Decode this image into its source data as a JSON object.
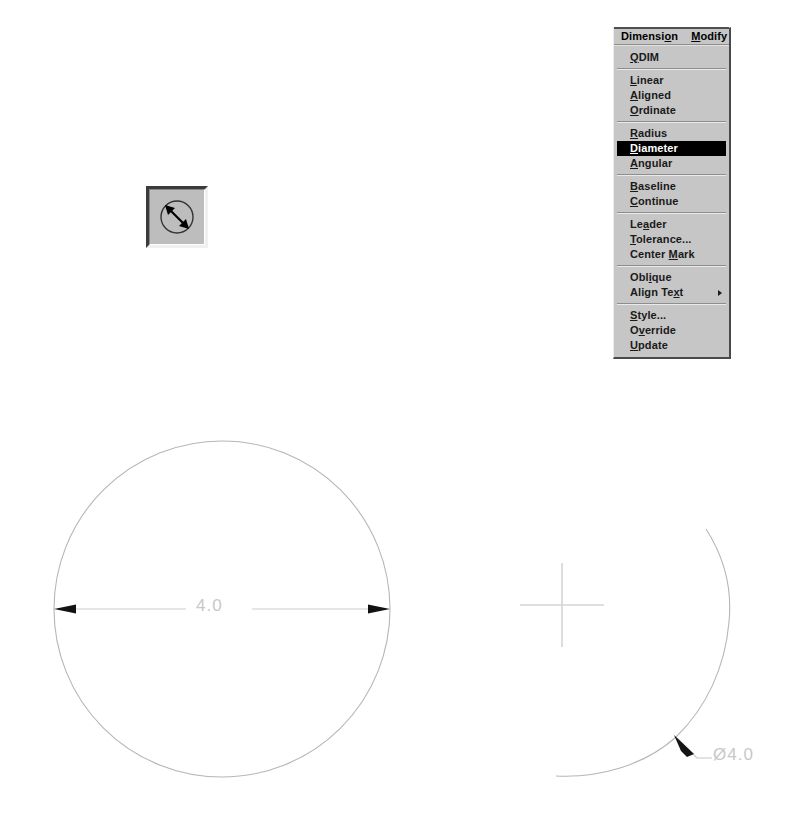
{
  "app": {
    "title": "AutoCAD Dimension Menu",
    "canvas_background": "#ffffff"
  },
  "toolbar": {
    "button": {
      "name": "diameter-dimension-tool",
      "tooltip_label": "Diameter",
      "icon": "circle-diameter-arrow-icon",
      "state": "pressed",
      "face_color": "#bdbdbd"
    }
  },
  "menu": {
    "bar": [
      {
        "label": "Dimension",
        "mnemonic_index": 7,
        "active": true
      },
      {
        "label": "Modify",
        "mnemonic_index": 0,
        "active": false
      }
    ],
    "dropdown_title": "Dimension",
    "groups": [
      {
        "items": [
          {
            "label": "QDIM",
            "mnemonic_index": 0,
            "selected": false,
            "submenu": false
          }
        ]
      },
      {
        "items": [
          {
            "label": "Linear",
            "mnemonic_index": 0,
            "selected": false,
            "submenu": false
          },
          {
            "label": "Aligned",
            "mnemonic_index": 0,
            "selected": false,
            "submenu": false
          },
          {
            "label": "Ordinate",
            "mnemonic_index": 0,
            "selected": false,
            "submenu": false
          }
        ]
      },
      {
        "items": [
          {
            "label": "Radius",
            "mnemonic_index": 0,
            "selected": false,
            "submenu": false
          },
          {
            "label": "Diameter",
            "mnemonic_index": 0,
            "selected": true,
            "submenu": false
          },
          {
            "label": "Angular",
            "mnemonic_index": 0,
            "selected": false,
            "submenu": false
          }
        ]
      },
      {
        "items": [
          {
            "label": "Baseline",
            "mnemonic_index": 0,
            "selected": false,
            "submenu": false
          },
          {
            "label": "Continue",
            "mnemonic_index": 0,
            "selected": false,
            "submenu": false
          }
        ]
      },
      {
        "items": [
          {
            "label": "Leader",
            "mnemonic_index": 2,
            "selected": false,
            "submenu": false
          },
          {
            "label": "Tolerance...",
            "mnemonic_index": 0,
            "selected": false,
            "submenu": false
          },
          {
            "label": "Center Mark",
            "mnemonic_index": 7,
            "selected": false,
            "submenu": false
          }
        ]
      },
      {
        "items": [
          {
            "label": "Oblique",
            "mnemonic_index": 3,
            "selected": false,
            "submenu": false
          },
          {
            "label": "Align Text",
            "mnemonic_index": 8,
            "selected": false,
            "submenu": true
          }
        ]
      },
      {
        "items": [
          {
            "label": "Style...",
            "mnemonic_index": 0,
            "selected": false,
            "submenu": false
          },
          {
            "label": "Override",
            "mnemonic_index": 1,
            "selected": false,
            "submenu": false
          },
          {
            "label": "Update",
            "mnemonic_index": 0,
            "selected": false,
            "submenu": false
          }
        ]
      }
    ],
    "colors": {
      "face": "#c6c6c6",
      "highlight_bg": "#000000",
      "highlight_fg": "#ffffff",
      "text": "#1a1a1a"
    }
  },
  "drawing": {
    "geometry_color": "#b4b4b4",
    "dimension_color": "#c8c8c8",
    "arrow_color": "#111111",
    "left_circle": {
      "name": "dimensioned-circle",
      "center_x": 222,
      "center_y": 609,
      "radius": 168
    },
    "left_dimension": {
      "name": "diameter-dimension-horizontal",
      "value": "4.0",
      "x1": 54,
      "x2": 390,
      "y": 609
    },
    "right_arc": {
      "name": "target-circle-arc",
      "center_x": 418,
      "center_y": 612,
      "radius": 312
    },
    "right_dimension": {
      "name": "diameter-dimension-leader",
      "value": "Ø4.0",
      "arrow_x": 678,
      "arrow_y": 739,
      "elbow_x": 697,
      "elbow_y": 758,
      "end_x": 712,
      "end_y": 758
    },
    "crosshair": {
      "name": "crosshair-cursor",
      "x": 562,
      "y": 605,
      "arm": 42
    }
  }
}
